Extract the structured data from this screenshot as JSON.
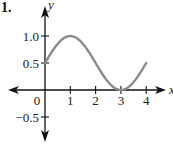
{
  "problem": {
    "label": "1."
  },
  "chart_data": {
    "type": "line",
    "title": "",
    "xlabel": "x",
    "ylabel": "y",
    "xlim": [
      -0.4,
      4.9
    ],
    "ylim": [
      -0.75,
      1.55
    ],
    "grid": false,
    "x_ticks": [
      {
        "value": 0,
        "label": "0"
      },
      {
        "value": 1,
        "label": "1"
      },
      {
        "value": 2,
        "label": "2"
      },
      {
        "value": 3,
        "label": "3"
      },
      {
        "value": 4,
        "label": "4"
      }
    ],
    "y_ticks": [
      {
        "value": 1.0,
        "label": "1.0"
      },
      {
        "value": 0.5,
        "label": "0.5"
      },
      {
        "value": -0.5,
        "label": "−0.5"
      }
    ],
    "series": [
      {
        "name": "y = 0.5 + 0.5 sin(πx/2)",
        "color": "#8a8a8a",
        "x": [
          0,
          0.5,
          1,
          1.5,
          2,
          2.5,
          3,
          3.5,
          4
        ],
        "y": [
          0.5,
          0.854,
          1.0,
          0.854,
          0.5,
          0.146,
          0.0,
          0.146,
          0.5
        ]
      }
    ],
    "colors": {
      "axis": "#111111",
      "curve": "#8a8a8a"
    }
  }
}
